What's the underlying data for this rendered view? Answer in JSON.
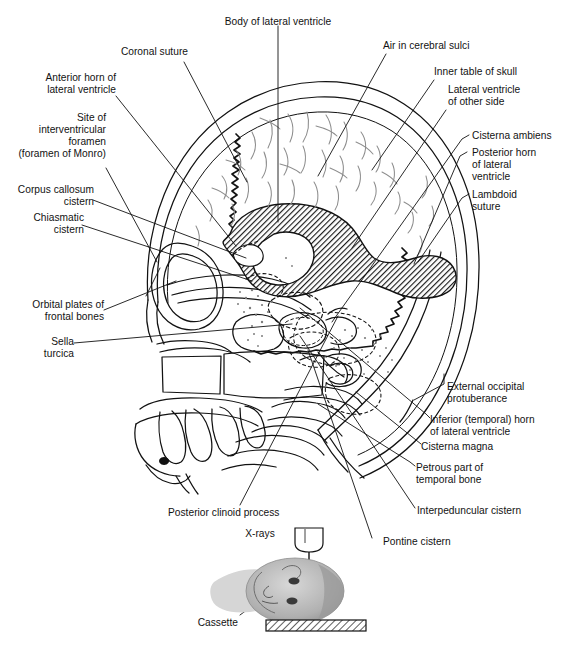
{
  "figure": {
    "type": "anatomical-diagram",
    "colors": {
      "ink": "#121212",
      "ventricle_fill": "#4a4a4a",
      "sulci_line": "#8a8a8a",
      "stipple": "#9a9a9a",
      "head_photo": "#b8b8b8"
    }
  },
  "labels": {
    "body_of_lateral_ventricle": "Body of lateral ventricle",
    "coronal_suture": "Coronal suture",
    "anterior_horn": "Anterior horn of\nlateral ventricle",
    "site_of_interventricular_foramen": "Site of\ninterventricular\nforamen\n(foramen of Monro)",
    "corpus_callosum_cistern": "Corpus callosum\ncistern",
    "chiasmatic_cistern": "Chiasmatic\ncistern",
    "orbital_plates": "Orbital plates of\nfrontal bones",
    "sella_turcica": "Sella\nturcica",
    "posterior_clinoid_process": "Posterior clinoid process",
    "air_in_cerebral_sulci": "Air in cerebral sulci",
    "inner_table_of_skull": "Inner table of skull",
    "lateral_ventricle_other_side": "Lateral ventricle\nof other side",
    "cisterna_ambiens": "Cisterna ambiens",
    "posterior_horn": "Posterior horn\nof lateral\nventricle",
    "lambdoid_suture": "Lambdoid\nsuture",
    "external_occipital_protuberance": "External occipital\nprotuberance",
    "inferior_temporal_horn": "Inferior (temporal) horn\nof lateral ventricle",
    "cisterna_magna": "Cisterna magna",
    "petrous_part": "Petrous part of\ntemporal bone",
    "interpeduncular_cistern": "Interpeduncular cistern",
    "pontine_cistern": "Pontine cistern",
    "xrays": "X-rays",
    "cassette": "Cassette"
  },
  "label_lines": {
    "body_of_lateral_ventricle": [
      "Body of lateral ventricle"
    ],
    "coronal_suture": [
      "Coronal suture"
    ],
    "anterior_horn": [
      "Anterior horn of",
      "lateral ventricle"
    ],
    "site_of_interventricular_foramen": [
      "Site of",
      "interventricular",
      "foramen",
      "(foramen of Monro)"
    ],
    "corpus_callosum_cistern": [
      "Corpus callosum",
      "cistern"
    ],
    "chiasmatic_cistern": [
      "Chiasmatic",
      "cistern"
    ],
    "orbital_plates": [
      "Orbital plates of",
      "frontal bones"
    ],
    "sella_turcica": [
      "Sella",
      "turcica"
    ],
    "posterior_clinoid_process": [
      "Posterior clinoid process"
    ],
    "air_in_cerebral_sulci": [
      "Air in cerebral sulci"
    ],
    "inner_table_of_skull": [
      "Inner table of skull"
    ],
    "lateral_ventricle_other_side": [
      "Lateral ventricle",
      "of other side"
    ],
    "cisterna_ambiens": [
      "Cisterna ambiens"
    ],
    "posterior_horn": [
      "Posterior horn",
      "of lateral",
      "ventricle"
    ],
    "lambdoid_suture": [
      "Lambdoid",
      "suture"
    ],
    "external_occipital_protuberance": [
      "External occipital",
      "protuberance"
    ],
    "inferior_temporal_horn": [
      "Inferior (temporal) horn",
      "of lateral ventricle"
    ],
    "cisterna_magna": [
      "Cisterna magna"
    ],
    "petrous_part": [
      "Petrous part of",
      "temporal bone"
    ],
    "interpeduncular_cistern": [
      "Interpeduncular cistern"
    ],
    "pontine_cistern": [
      "Pontine cistern"
    ],
    "xrays": [
      "X-rays"
    ],
    "cassette": [
      "Cassette"
    ]
  }
}
